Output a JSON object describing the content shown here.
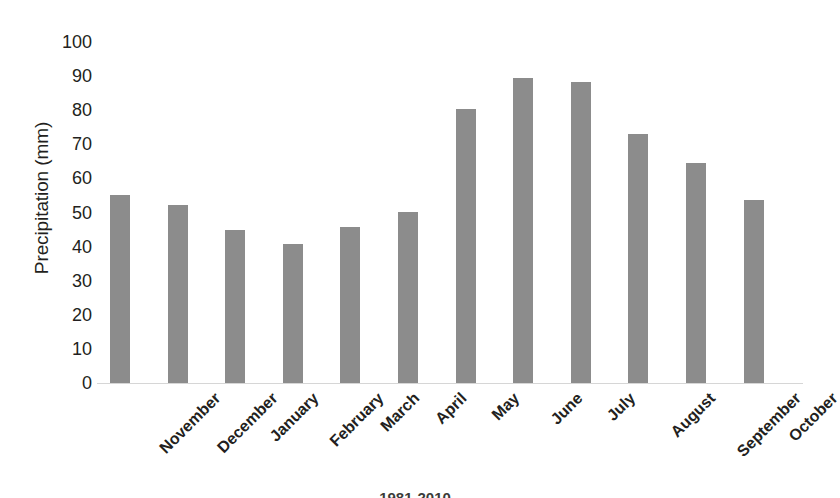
{
  "chart_data": {
    "type": "bar",
    "title": "",
    "xlabel": "",
    "ylabel": "Precipitation (mm)",
    "ylim": [
      0,
      100
    ],
    "ytick_step": 10,
    "yticks": [
      "100",
      "90",
      "80",
      "70",
      "60",
      "50",
      "40",
      "30",
      "20",
      "10",
      "0"
    ],
    "grid": false,
    "legend": "none",
    "bar_color": "#8c8c8c",
    "categories": [
      "November",
      "December",
      "January",
      "February",
      "March",
      "April",
      "May",
      "June",
      "July",
      "August",
      "September",
      "October"
    ],
    "values": [
      55,
      52.3,
      44.8,
      40.7,
      45.7,
      50.1,
      80.5,
      89.4,
      88.3,
      73,
      64.6,
      53.6
    ]
  },
  "axis": {
    "y_title": "Precipitation (mm)"
  },
  "caption": {
    "text": "1981-2010"
  }
}
